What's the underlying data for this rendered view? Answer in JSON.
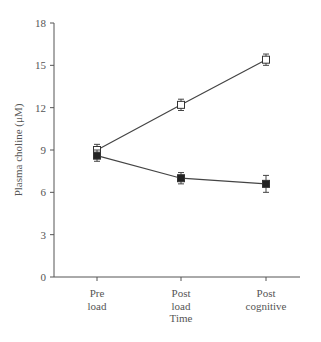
{
  "chart_data": {
    "type": "line",
    "title": "",
    "xlabel": "Time",
    "ylabel": "Plasma choline (μM)",
    "categories": [
      "Pre load",
      "Post load",
      "Post cognitive"
    ],
    "category_lines": [
      [
        "Pre",
        "load"
      ],
      [
        "Post",
        "load"
      ],
      [
        "Post",
        "cognitive"
      ]
    ],
    "ylim": [
      0,
      18
    ],
    "yticks": [
      0,
      3,
      6,
      9,
      12,
      15,
      18
    ],
    "grid": false,
    "legend": "none",
    "series": [
      {
        "name": "open squares",
        "marker": "open-square",
        "values": [
          9.0,
          12.2,
          15.4
        ],
        "errors": [
          0.4,
          0.4,
          0.4
        ]
      },
      {
        "name": "filled squares",
        "marker": "filled-square",
        "values": [
          8.6,
          7.0,
          6.6
        ],
        "errors": [
          0.4,
          0.4,
          0.6
        ]
      }
    ]
  }
}
